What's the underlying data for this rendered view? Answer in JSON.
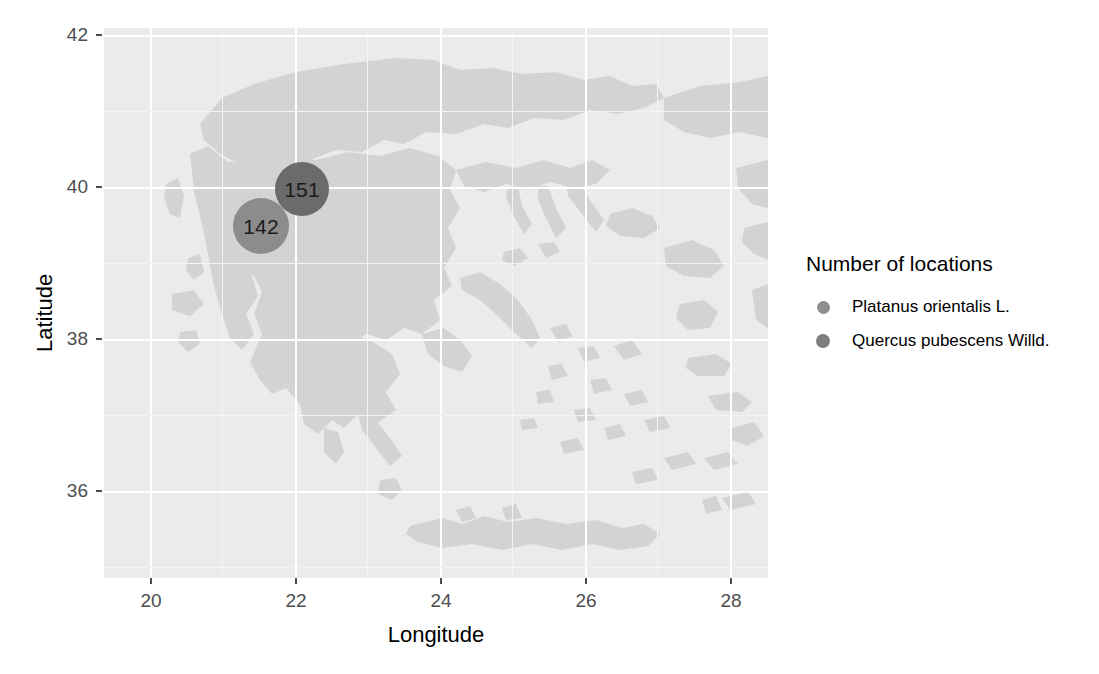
{
  "chart_data": {
    "type": "scatter",
    "title": "",
    "xlabel": "Longitude",
    "ylabel": "Latitude",
    "xlim": [
      19.35,
      28.65
    ],
    "ylim": [
      34.55,
      42.2
    ],
    "xticks": [
      20,
      22,
      24,
      26,
      28
    ],
    "yticks": [
      36,
      38,
      40,
      42
    ],
    "xtick_labels": [
      "20",
      "22",
      "24",
      "26",
      "28"
    ],
    "ytick_labels": [
      "36",
      "38",
      "40",
      "42"
    ],
    "grid": true,
    "legend_position": "right",
    "legend_title": "Number of locations",
    "basemap": "Greece and the Aegean",
    "series": [
      {
        "name": "Platanus orientalis L.",
        "color": "#8c8c8c",
        "points": [
          {
            "label": "142",
            "value": 142,
            "x": 21.5,
            "y": 39.4,
            "radius_px": 28
          }
        ]
      },
      {
        "name": "Quercus pubescens Willd.",
        "color": "#6b6b6b",
        "points": [
          {
            "label": "151",
            "value": 151,
            "x": 22.05,
            "y": 39.9,
            "radius_px": 27
          }
        ]
      }
    ]
  },
  "axes": {
    "x_title": "Longitude",
    "y_title": "Latitude",
    "x_ticks": [
      {
        "label": "20",
        "px": 151
      },
      {
        "label": "22",
        "px": 296
      },
      {
        "label": "24",
        "px": 441
      },
      {
        "label": "26",
        "px": 586
      },
      {
        "label": "28",
        "px": 731
      }
    ],
    "y_ticks": [
      {
        "label": "42",
        "px": 35
      },
      {
        "label": "40",
        "px": 187
      },
      {
        "label": "38",
        "px": 339
      },
      {
        "label": "36",
        "px": 491
      }
    ]
  },
  "bubbles": [
    {
      "label": "142",
      "cx": 261,
      "cy": 226,
      "r": 28,
      "color": "#8c8c8c"
    },
    {
      "label": "151",
      "cx": 302,
      "cy": 189,
      "r": 27,
      "color": "#6b6b6b"
    }
  ],
  "legend": {
    "title": "Number of locations",
    "items": [
      {
        "label": "Platanus orientalis L.",
        "color": "#8f8f8f",
        "dot": 13
      },
      {
        "label": "Quercus pubescens Willd.",
        "color": "#7d7d7d",
        "dot": 14
      }
    ]
  },
  "colors": {
    "panel_background": "#ebebeb",
    "gridline": "#ffffff",
    "land": "#d2d2d2",
    "tick_text": "#4d4d4d",
    "title_text": "#000000"
  }
}
